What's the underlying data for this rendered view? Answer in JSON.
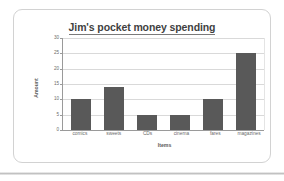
{
  "chart_data": {
    "type": "bar",
    "title": "Jim's pocket money spending",
    "xlabel": "Items",
    "ylabel": "Amount",
    "categories": [
      "comics",
      "sweets",
      "CDs",
      "cinema",
      "fares",
      "magazines"
    ],
    "values": [
      10,
      14,
      5,
      5,
      10,
      25
    ],
    "yticks": [
      0,
      5,
      10,
      15,
      20,
      25,
      30
    ],
    "ylim": [
      0,
      30
    ],
    "grid": true,
    "legend": false,
    "bar_color": "#595959",
    "gridline_color": "#d9d9d9",
    "axis_color": "#9a9a9a",
    "title_color": "#3f3f3f"
  },
  "card": {
    "border_color": "#d2d2d2"
  }
}
